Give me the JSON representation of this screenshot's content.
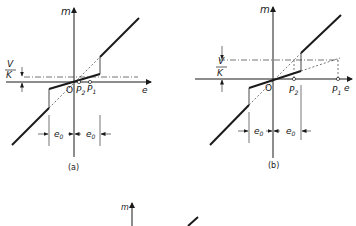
{
  "figure": {
    "panels": [
      {
        "id": "a",
        "caption": "(a)",
        "axis_y_label": "m",
        "axis_x_label": "e",
        "origin_label": "O",
        "offset_label_num": "V",
        "offset_label_den": "K",
        "point_labels": [
          {
            "name": "P",
            "sub": "2"
          },
          {
            "name": "P",
            "sub": "1"
          }
        ],
        "deadband_labels": [
          {
            "name": "e",
            "sub": "0"
          },
          {
            "name": "e",
            "sub": "0"
          }
        ]
      },
      {
        "id": "b",
        "caption": "(b)",
        "axis_y_label": "m",
        "axis_x_label": "e",
        "origin_label": "O",
        "offset_label_num": "V",
        "offset_label_den": "K",
        "point_labels": [
          {
            "name": "P",
            "sub": "2"
          },
          {
            "name": "P",
            "sub": "1"
          }
        ],
        "deadband_labels": [
          {
            "name": "e",
            "sub": "0"
          },
          {
            "name": "e",
            "sub": "0"
          }
        ]
      },
      {
        "id": "c",
        "caption": "",
        "axis_y_label": "m"
      }
    ],
    "colors": {
      "ink": "#1a1a1a",
      "background": "#ffffff"
    }
  }
}
